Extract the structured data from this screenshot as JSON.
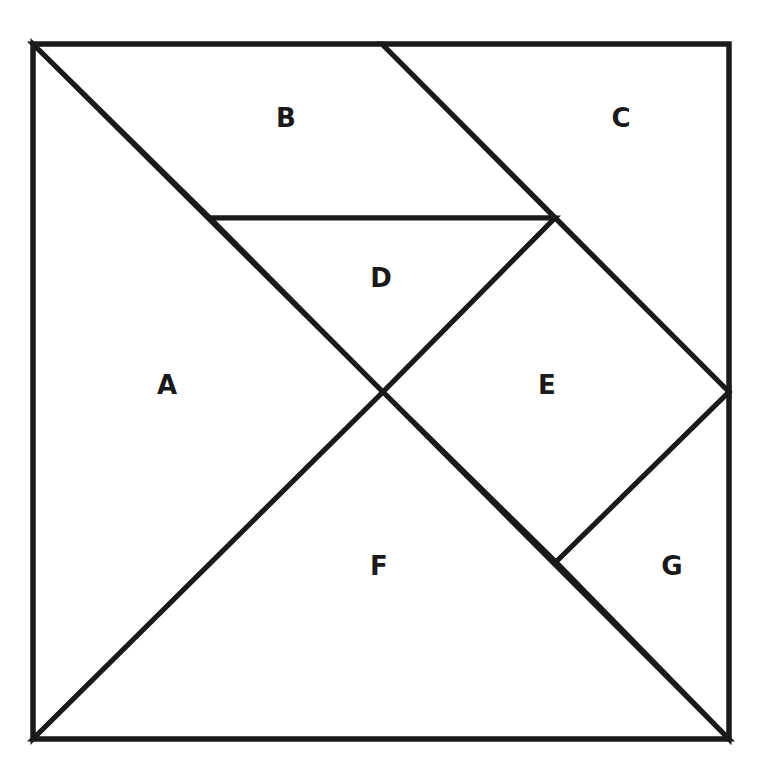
{
  "diagram": {
    "type": "tangram",
    "stroke_color": "#1a1a1a",
    "fill_color": "#ffffff",
    "outer_square": {
      "x": 33,
      "y": 44,
      "width": 696,
      "height": 695
    },
    "pieces": [
      {
        "id": "A",
        "label": "A",
        "shape": "large-triangle",
        "points": "33,44 383,392 33,739",
        "label_pos": [
          167,
          385
        ]
      },
      {
        "id": "B",
        "label": "B",
        "shape": "parallelogram",
        "points": "33,44 382,44 555,218 210,218",
        "label_pos": [
          286,
          118
        ]
      },
      {
        "id": "C",
        "label": "C",
        "shape": "medium-triangle",
        "points": "382,44 729,44 729,392",
        "label_pos": [
          621,
          118
        ]
      },
      {
        "id": "D",
        "label": "D",
        "shape": "small-triangle",
        "points": "210,218 555,218 383,392",
        "label_pos": [
          381,
          278
        ]
      },
      {
        "id": "E",
        "label": "E",
        "shape": "square",
        "points": "555,218 729,392 556,562 383,392",
        "label_pos": [
          547,
          385
        ]
      },
      {
        "id": "F",
        "label": "F",
        "shape": "large-triangle",
        "points": "383,392 729,739 33,739",
        "label_pos": [
          379,
          566
        ]
      },
      {
        "id": "G",
        "label": "G",
        "shape": "small-triangle",
        "points": "729,392 729,739 556,562",
        "label_pos": [
          672,
          566
        ]
      }
    ]
  }
}
